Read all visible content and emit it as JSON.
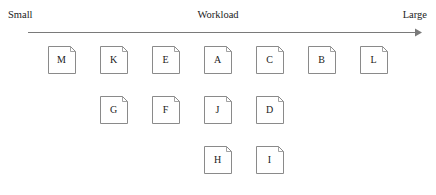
{
  "axis": {
    "left_label": "Small",
    "title": "Workload",
    "right_label": "Large",
    "arrow_icon": "right-arrow-icon"
  },
  "style": {
    "node_border_color": "#8a8a8a",
    "node_fill_color": "#ffffff",
    "axis_line_color": "#7a7a7a",
    "text_color": "#1a1a1a",
    "background_color": "#ffffff"
  },
  "chart_data": {
    "type": "diagram",
    "title": "Workload",
    "xlabel": "Workload",
    "axis_min_label": "Small",
    "axis_max_label": "Large",
    "grid": false,
    "columns": 7,
    "rows": 3,
    "column_x": [
      48,
      100,
      152,
      204,
      256,
      308,
      360
    ],
    "row_y": [
      46,
      96,
      146
    ],
    "node_shape": "document-folded-corner",
    "node_size": 28,
    "nodes": [
      {
        "label": "M",
        "column": 0,
        "row": 0,
        "x": 48,
        "y": 46
      },
      {
        "label": "K",
        "column": 1,
        "row": 0,
        "x": 100,
        "y": 46
      },
      {
        "label": "E",
        "column": 2,
        "row": 0,
        "x": 152,
        "y": 46
      },
      {
        "label": "A",
        "column": 3,
        "row": 0,
        "x": 204,
        "y": 46
      },
      {
        "label": "C",
        "column": 4,
        "row": 0,
        "x": 256,
        "y": 46
      },
      {
        "label": "B",
        "column": 5,
        "row": 0,
        "x": 308,
        "y": 46
      },
      {
        "label": "L",
        "column": 6,
        "row": 0,
        "x": 360,
        "y": 46
      },
      {
        "label": "G",
        "column": 1,
        "row": 1,
        "x": 100,
        "y": 96
      },
      {
        "label": "F",
        "column": 2,
        "row": 1,
        "x": 152,
        "y": 96
      },
      {
        "label": "J",
        "column": 3,
        "row": 1,
        "x": 204,
        "y": 96
      },
      {
        "label": "D",
        "column": 4,
        "row": 1,
        "x": 256,
        "y": 96
      },
      {
        "label": "H",
        "column": 3,
        "row": 2,
        "x": 204,
        "y": 146
      },
      {
        "label": "I",
        "column": 4,
        "row": 2,
        "x": 256,
        "y": 146
      }
    ],
    "row_contents": [
      [
        "M",
        "K",
        "E",
        "A",
        "C",
        "B",
        "L"
      ],
      [
        "G",
        "F",
        "J",
        "D"
      ],
      [
        "H",
        "I"
      ]
    ]
  }
}
